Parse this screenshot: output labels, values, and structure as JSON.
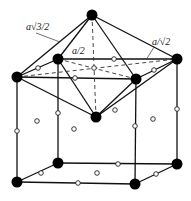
{
  "diagram": {
    "labels": [
      {
        "id": "label-a-sqrt3-2",
        "text": "a√3/2",
        "x": 26,
        "y": 28
      },
      {
        "id": "label-a-2",
        "text": "a/2",
        "x": 72,
        "y": 53
      },
      {
        "id": "label-a-sqrt2",
        "text": "a/√2",
        "x": 152,
        "y": 44
      }
    ],
    "large_atoms": [
      {
        "id": "top-apex",
        "x": 92,
        "y": 15
      },
      {
        "id": "upper-back-left",
        "x": 58,
        "y": 59
      },
      {
        "id": "upper-back-right",
        "x": 177,
        "y": 59
      },
      {
        "id": "upper-front-left",
        "x": 17,
        "y": 77
      },
      {
        "id": "upper-front-right",
        "x": 136,
        "y": 79
      },
      {
        "id": "lower-apex",
        "x": 96,
        "y": 117
      },
      {
        "id": "bottom-back-left",
        "x": 58,
        "y": 163
      },
      {
        "id": "bottom-back-right",
        "x": 177,
        "y": 164
      },
      {
        "id": "bottom-front-left",
        "x": 17,
        "y": 182
      },
      {
        "id": "bottom-front-right",
        "x": 135,
        "y": 184
      }
    ],
    "small_atoms": [
      {
        "x": 114,
        "y": 59
      },
      {
        "x": 38,
        "y": 68
      },
      {
        "x": 154,
        "y": 70
      },
      {
        "x": 75,
        "y": 78
      },
      {
        "x": 94,
        "y": 68
      },
      {
        "x": 58,
        "y": 113
      },
      {
        "x": 17,
        "y": 131
      },
      {
        "x": 37,
        "y": 121
      },
      {
        "x": 74,
        "y": 129
      },
      {
        "x": 115,
        "y": 110
      },
      {
        "x": 135,
        "y": 126
      },
      {
        "x": 153,
        "y": 119
      },
      {
        "x": 177,
        "y": 109
      },
      {
        "x": 118,
        "y": 164
      },
      {
        "x": 41,
        "y": 173
      },
      {
        "x": 97,
        "y": 173
      },
      {
        "x": 156,
        "y": 174
      },
      {
        "x": 78,
        "y": 183
      }
    ]
  }
}
